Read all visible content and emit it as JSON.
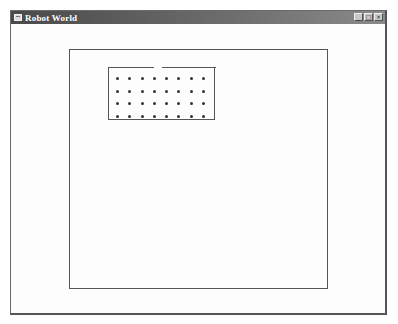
{
  "window": {
    "title": "Robot World",
    "icon": "app-window-icon",
    "controls": [
      {
        "name": "minimize",
        "icon": "minimize-icon",
        "glyph": "_"
      },
      {
        "name": "maximize",
        "icon": "maximize-icon",
        "glyph": "□"
      },
      {
        "name": "close",
        "icon": "close-icon",
        "glyph": "×"
      }
    ]
  },
  "world": {
    "arena": {
      "shape": "rectangle"
    },
    "room": {
      "has_door": true,
      "door_position": "top",
      "beeper_grid": {
        "columns": 8,
        "rows": 4
      }
    }
  },
  "colors": {
    "titlebar": "#4a4a4a",
    "wall": "#555555",
    "background": "#fdfdfd",
    "dot": "#333333"
  }
}
